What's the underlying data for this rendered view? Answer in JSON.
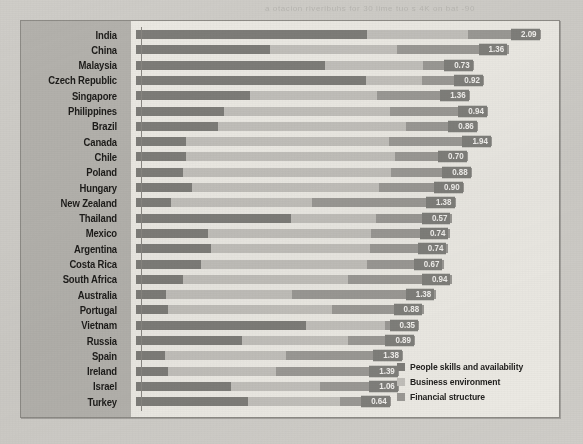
{
  "ghost_text": "a otacion riveribuhs for 30 lime tuo s 4K on bat -90",
  "legend": {
    "items": [
      {
        "label": "People skills and availability",
        "color": "#7e7d79",
        "key": "people"
      },
      {
        "label": "Business environment",
        "color": "#c2c0bb",
        "key": "business"
      },
      {
        "label": "Financial structure",
        "color": "#9b9995",
        "key": "finance"
      }
    ]
  },
  "chart_data": {
    "type": "bar",
    "orientation": "horizontal",
    "stacked": true,
    "title": "",
    "xlabel": "",
    "ylabel": "",
    "grid": false,
    "legend_position": "bottom-right",
    "series": [
      {
        "name": "People skills and availability",
        "color": "#7e7d79"
      },
      {
        "name": "Business environment",
        "color": "#c2c0bb"
      },
      {
        "name": "Financial structure",
        "color": "#9b9995"
      }
    ],
    "categories": [
      "India",
      "China",
      "Malaysia",
      "Czech Republic",
      "Singapore",
      "Philippines",
      "Brazil",
      "Canada",
      "Chile",
      "Poland",
      "Hungary",
      "New Zealand",
      "Thailand",
      "Mexico",
      "Argentina",
      "Costa Rica",
      "South Africa",
      "Australia",
      "Portugal",
      "Vietnam",
      "Russia",
      "Spain",
      "Ireland",
      "Israel",
      "Turkey"
    ],
    "values": [
      2.09,
      1.36,
      0.73,
      0.92,
      1.36,
      0.94,
      0.86,
      1.94,
      0.7,
      0.88,
      0.9,
      1.38,
      0.57,
      0.74,
      0.74,
      0.67,
      0.94,
      1.38,
      0.88,
      0.35,
      0.89,
      1.38,
      1.39,
      1.06,
      0.64
    ],
    "rows": [
      {
        "country": "India",
        "value": "2.09",
        "total": 100.0,
        "people": 57,
        "business": 25,
        "finance": 18
      },
      {
        "country": "China",
        "value": "1.36",
        "total": 92.0,
        "people": 36,
        "business": 34,
        "finance": 30
      },
      {
        "country": "Malaysia",
        "value": "0.73",
        "total": 83.5,
        "people": 56,
        "business": 29,
        "finance": 15
      },
      {
        "country": "Czech Republic",
        "value": "0.92",
        "total": 86.0,
        "people": 66,
        "business": 16,
        "finance": 18
      },
      {
        "country": "Singapore",
        "value": "1.36",
        "total": 82.5,
        "people": 34,
        "business": 38,
        "finance": 28
      },
      {
        "country": "Philippines",
        "value": "0.94",
        "total": 87.0,
        "people": 25,
        "business": 47,
        "finance": 28
      },
      {
        "country": "Brazil",
        "value": "0.86",
        "total": 84.5,
        "people": 24,
        "business": 55,
        "finance": 21
      },
      {
        "country": "Canada",
        "value": "1.94",
        "total": 88.0,
        "people": 14,
        "business": 57,
        "finance": 29
      },
      {
        "country": "Chile",
        "value": "0.70",
        "total": 82.0,
        "people": 15,
        "business": 63,
        "finance": 22
      },
      {
        "country": "Poland",
        "value": "0.88",
        "total": 83.0,
        "people": 14,
        "business": 62,
        "finance": 24
      },
      {
        "country": "Hungary",
        "value": "0.90",
        "total": 81.0,
        "people": 17,
        "business": 57,
        "finance": 26
      },
      {
        "country": "New Zealand",
        "value": "1.38",
        "total": 79.0,
        "people": 11,
        "business": 44,
        "finance": 45
      },
      {
        "country": "Thailand",
        "value": "0.57",
        "total": 78.0,
        "people": 49,
        "business": 27,
        "finance": 24
      },
      {
        "country": "Mexico",
        "value": "0.74",
        "total": 77.5,
        "people": 23,
        "business": 52,
        "finance": 25
      },
      {
        "country": "Argentina",
        "value": "0.74",
        "total": 77.0,
        "people": 24,
        "business": 51,
        "finance": 25
      },
      {
        "country": "Costa Rica",
        "value": "0.67",
        "total": 76.0,
        "people": 21,
        "business": 54,
        "finance": 25
      },
      {
        "country": "South Africa",
        "value": "0.94",
        "total": 78.0,
        "people": 15,
        "business": 52,
        "finance": 33
      },
      {
        "country": "Australia",
        "value": "1.38",
        "total": 74.0,
        "people": 10,
        "business": 42,
        "finance": 48
      },
      {
        "country": "Portugal",
        "value": "0.88",
        "total": 71.0,
        "people": 11,
        "business": 57,
        "finance": 32
      },
      {
        "country": "Vietnam",
        "value": "0.35",
        "total": 70.0,
        "people": 60,
        "business": 28,
        "finance": 12
      },
      {
        "country": "Russia",
        "value": "0.89",
        "total": 69.0,
        "people": 38,
        "business": 38,
        "finance": 24
      },
      {
        "country": "Spain",
        "value": "1.38",
        "total": 66.0,
        "people": 11,
        "business": 45,
        "finance": 44
      },
      {
        "country": "Ireland",
        "value": "1.39",
        "total": 65.0,
        "people": 12,
        "business": 41,
        "finance": 47
      },
      {
        "country": "Israel",
        "value": "1.06",
        "total": 65.0,
        "people": 36,
        "business": 34,
        "finance": 30
      },
      {
        "country": "Turkey",
        "value": "0.64",
        "total": 63.0,
        "people": 44,
        "business": 36,
        "finance": 20
      }
    ]
  }
}
